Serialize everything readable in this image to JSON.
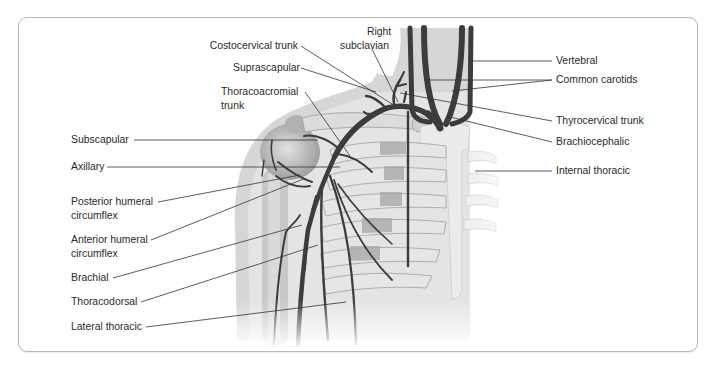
{
  "figure": {
    "type": "anatomical-diagram"
  },
  "labels_left": [
    {
      "id": "subscapular",
      "text": "Subscapular"
    },
    {
      "id": "axillary",
      "text": "Axillary"
    },
    {
      "id": "posterior-humeral-circumflex",
      "line1": "Posterior humeral",
      "line2": "circumflex"
    },
    {
      "id": "anterior-humeral-circumflex",
      "line1": "Anterior humeral",
      "line2": "circumflex"
    },
    {
      "id": "brachial",
      "text": "Brachial"
    },
    {
      "id": "thoracodorsal",
      "text": "Thoracodorsal"
    },
    {
      "id": "lateral-thoracic",
      "text": "Lateral thoracic"
    }
  ],
  "labels_top": [
    {
      "id": "costocervical-trunk",
      "text": "Costocervical trunk"
    },
    {
      "id": "suprascapular",
      "text": "Suprascapular"
    },
    {
      "id": "thoracoacromial-trunk",
      "line1": "Thoracoacromial",
      "line2": "trunk"
    },
    {
      "id": "right-subclavian",
      "line1": "Right",
      "line2": "subclavian"
    }
  ],
  "labels_right": [
    {
      "id": "vertebral",
      "text": "Vertebral"
    },
    {
      "id": "common-carotids",
      "text": "Common carotids"
    },
    {
      "id": "thyrocervical-trunk",
      "text": "Thyrocervical trunk"
    },
    {
      "id": "brachiocephalic",
      "text": "Brachiocephalic"
    },
    {
      "id": "internal-thoracic",
      "text": "Internal thoracic"
    }
  ],
  "colors": {
    "artery": "#3c3c3c",
    "bone": "#ececec",
    "bone_shadow": "#bdbdbd",
    "cartilage": "#a8a8a8",
    "skin": "#d4d4d4",
    "leader": "#333333",
    "frame": "#b8b8b8"
  }
}
